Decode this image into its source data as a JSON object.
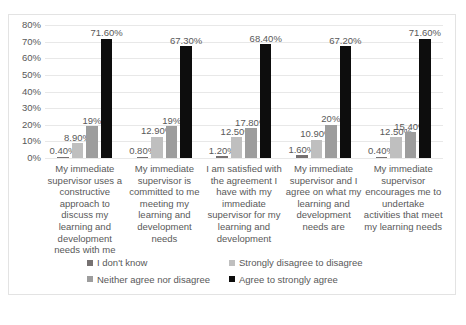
{
  "chart_data": {
    "type": "bar",
    "title": "",
    "subtitle": "",
    "xlabel": "",
    "ylabel": "",
    "ylim": [
      0,
      80
    ],
    "ytick_labels": [
      "80%",
      "70%",
      "60%",
      "50%",
      "40%",
      "30%",
      "20%",
      "10%",
      "0%"
    ],
    "ytick_values": [
      80,
      70,
      60,
      50,
      40,
      30,
      20,
      10,
      0
    ],
    "grid": true,
    "legend_position": "bottom",
    "categories": [
      "My immediate supervisor uses a constructive approach to discuss my learning and development needs with me",
      "My immediate supervisor is committed to me meeting my learning and development needs",
      "I am satisfied with the agreement I have with my immediate supervisor for my learning and development",
      "My immediate supervisor and I agree on what my learning and development needs are",
      "My immediate supervisor encourages me to undertake activities that meet my learning needs"
    ],
    "series": [
      {
        "name": "I don't know",
        "color": "#767171",
        "values": [
          0.4,
          0.8,
          1.2,
          1.6,
          0.4
        ],
        "labels": [
          "0.40%",
          "0.80%",
          "1.20%",
          "1.60%",
          "0.40%"
        ]
      },
      {
        "name": "Strongly disagree to disagree",
        "color": "#bfbfbf",
        "values": [
          8.9,
          12.9,
          12.5,
          10.9,
          12.5
        ],
        "labels": [
          "8.90%",
          "12.90%",
          "12.50%",
          "10.90%",
          "12.50%"
        ]
      },
      {
        "name": "Neither agree nor disagree",
        "color": "#9d9d9d",
        "values": [
          19.0,
          19.0,
          17.8,
          20.0,
          15.4
        ],
        "labels": [
          "19%",
          "19%",
          "17.80%",
          "20%",
          "15.40%"
        ]
      },
      {
        "name": "Agree to strongly agree",
        "color": "#0d0d0d",
        "values": [
          71.6,
          67.3,
          68.4,
          67.2,
          71.6
        ],
        "labels": [
          "71.60%",
          "67.30%",
          "68.40%",
          "67.20%",
          "71.60%"
        ]
      }
    ]
  },
  "caption": {
    "text": ""
  }
}
